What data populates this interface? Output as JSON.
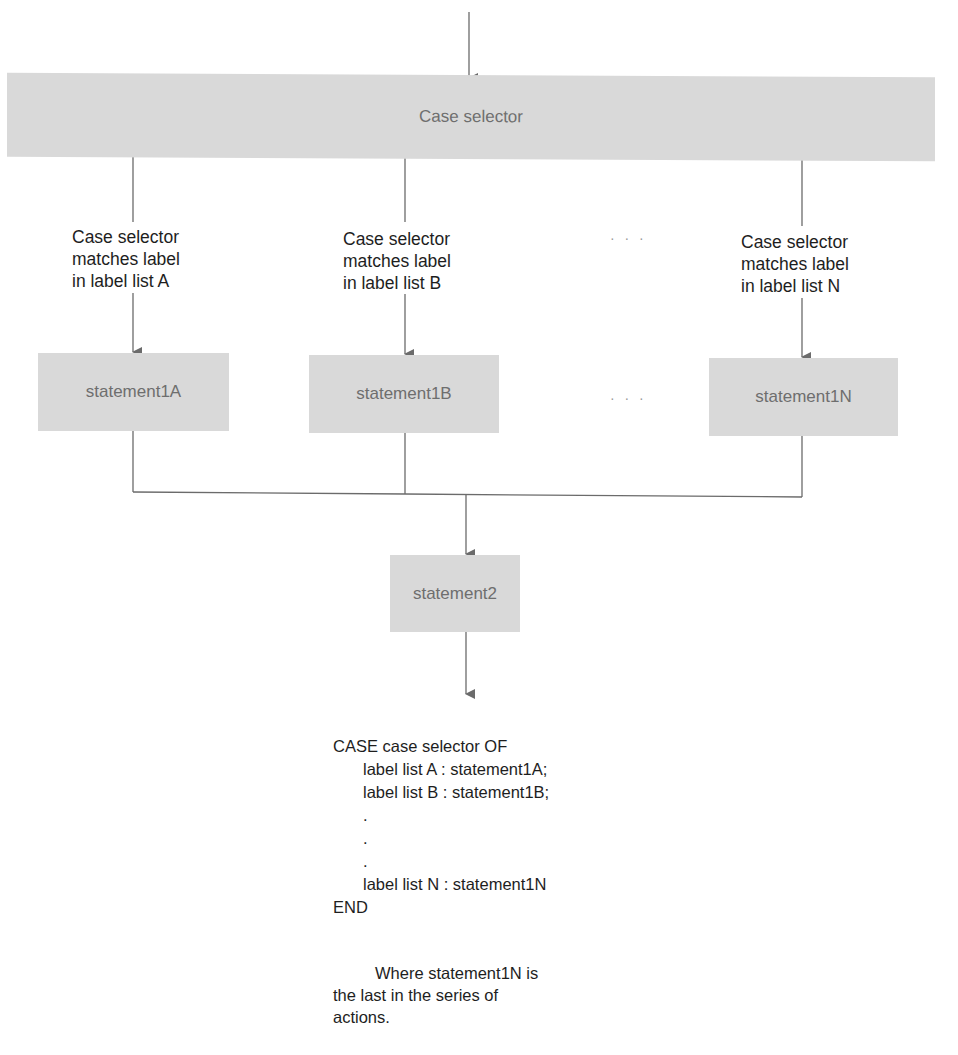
{
  "diagram": {
    "type": "flowchart",
    "selector": {
      "label": "Case selector"
    },
    "branches": [
      {
        "id": "A",
        "condition_lines": [
          "Case selector",
          "matches label",
          "in label list A"
        ],
        "statement": "statement1A"
      },
      {
        "id": "B",
        "condition_lines": [
          "Case selector",
          "matches label",
          "in label list B"
        ],
        "statement": "statement1B"
      },
      {
        "id": "N",
        "condition_lines": [
          "Case selector",
          "matches label",
          "in label list N"
        ],
        "statement": "statement1N"
      }
    ],
    "ellipsis": "· · ·",
    "join": {
      "statement": "statement2"
    },
    "colors": {
      "box_fill": "#d9d9d9",
      "box_text": "#6e6e6e",
      "line": "#6b6b6b",
      "text": "#1e1e1e"
    }
  },
  "code": {
    "lines": [
      "CASE case selector OF",
      "label list A : statement1A;",
      "label list B : statement1B;",
      ".",
      ".",
      ".",
      "label list N : statement1N",
      "END"
    ]
  },
  "note": {
    "first_line": "Where statement1N is",
    "rest": "the last in the series of actions."
  }
}
